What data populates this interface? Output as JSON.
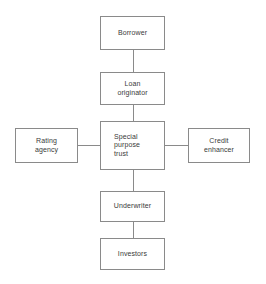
{
  "diagram": {
    "colors": {
      "box_border": "#8a8a8a",
      "connector": "#8a8a8a",
      "text": "#3a3a3a",
      "background": "#ffffff"
    },
    "nodes": [
      {
        "id": "borrower",
        "label": "Borrower"
      },
      {
        "id": "loan-originator",
        "label": "Loan\noriginator"
      },
      {
        "id": "rating-agency",
        "label": "Rating\nagency"
      },
      {
        "id": "special-purpose-trust",
        "label": "Special\npurpose\ntrust"
      },
      {
        "id": "credit-enhancer",
        "label": "Credit\nenhancer"
      },
      {
        "id": "underwriter",
        "label": "Underwriter"
      },
      {
        "id": "investors",
        "label": "Investors"
      }
    ],
    "connectors": [
      {
        "id": "borrower-to-loan-originator",
        "orientation": "vertical"
      },
      {
        "id": "loan-originator-to-special-purpose-trust",
        "orientation": "vertical"
      },
      {
        "id": "rating-agency-to-special-purpose-trust",
        "orientation": "horizontal"
      },
      {
        "id": "special-purpose-trust-to-credit-enhancer",
        "orientation": "horizontal"
      },
      {
        "id": "special-purpose-trust-to-underwriter",
        "orientation": "vertical"
      },
      {
        "id": "underwriter-to-investors",
        "orientation": "vertical"
      }
    ]
  }
}
